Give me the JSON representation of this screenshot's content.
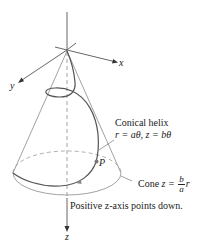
{
  "figure": {
    "axes": {
      "x_label": "x",
      "y_label": "y",
      "z_label": "z"
    },
    "helix_label": {
      "title": "Conical helix",
      "equation": "r = aθ, z = bθ"
    },
    "point_label": "P",
    "cone_label": {
      "prefix": "Cone ",
      "lhs": "z = ",
      "numerator": "b",
      "denominator": "a",
      "suffix": "r"
    },
    "z_axis_note": "Positive z-axis points down.",
    "colors": {
      "axis": "#444444",
      "cone": "#7a7a7a",
      "helix": "#555555",
      "point": "#777777",
      "text": "#222222"
    }
  }
}
